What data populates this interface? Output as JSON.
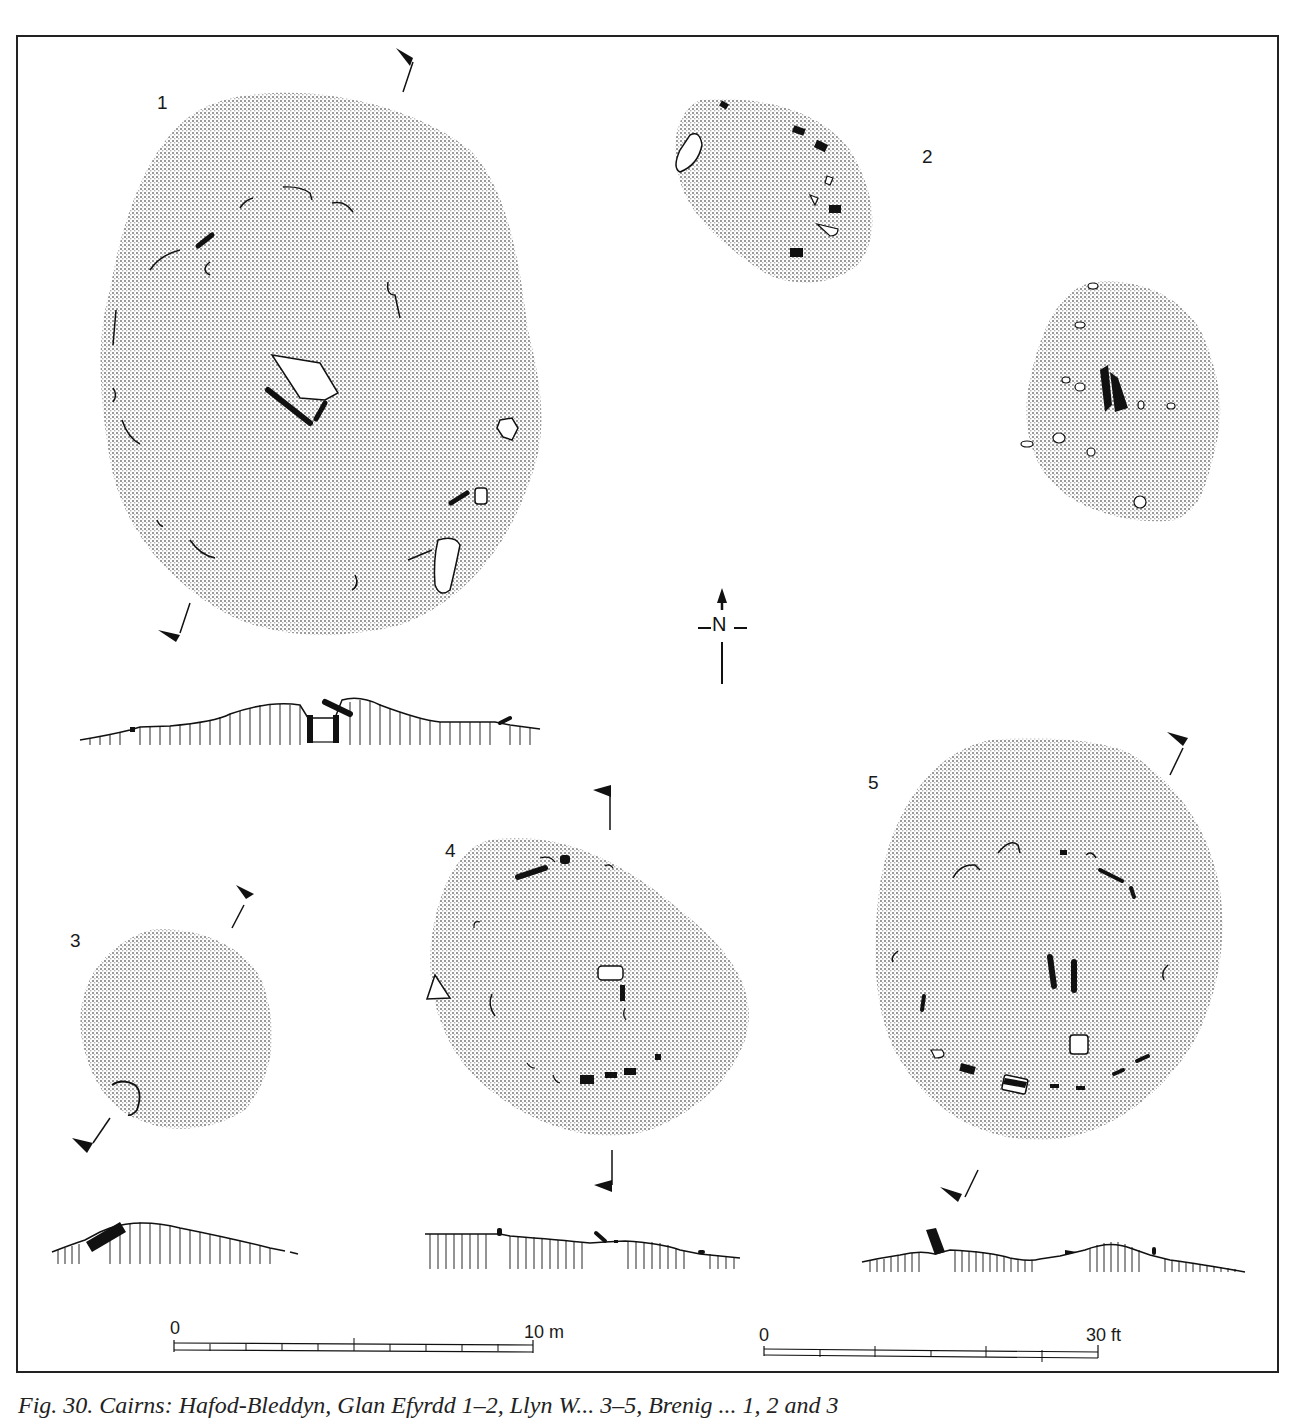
{
  "figure": {
    "caption": "Fig. 30. Cairns: Hafod-Bleddyn, Glan Efyrdd 1–2, Llyn W... 3–5, Brenig ... 1, 2 and 3",
    "caption_visible_fragment": "Fig. 30. Cairns ... Glan Efyrdd 1, 2 ... 3–5 ...",
    "plans": [
      {
        "id": "1",
        "label": "1"
      },
      {
        "id": "2",
        "label": "2"
      },
      {
        "id": "3",
        "label": "3"
      },
      {
        "id": "4",
        "label": "4"
      },
      {
        "id": "5",
        "label": "5"
      }
    ],
    "north_arrow": {
      "label": "N"
    },
    "scale_bars": [
      {
        "start": "0",
        "end": "10 m",
        "divisions": 10
      },
      {
        "start": "0",
        "end": "30 ft",
        "divisions": 6
      }
    ]
  },
  "colors": {
    "stipple": "#c9c9c9",
    "ink": "#111111",
    "frame": "#222222",
    "background": "#ffffff"
  }
}
